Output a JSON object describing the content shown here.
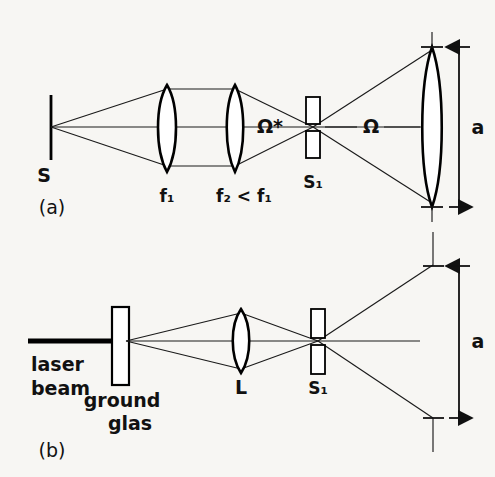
{
  "figure": {
    "background_color": "#f7f6f3",
    "ink_color": "#111111",
    "width": 495,
    "height": 477
  },
  "panels": [
    {
      "id": "panel-a",
      "label": "(a)",
      "description": "Incoherent source imaged through two lenses onto a slit, then diverging to a collecting lens",
      "elements": {
        "source_label": "S",
        "lens1_label": "f₁",
        "lens2_label": "f₂ < f₁",
        "slit_label": "S₁",
        "solid_angle_star": "Ω*",
        "solid_angle": "Ω",
        "aperture_label": "a"
      }
    },
    {
      "id": "panel-b",
      "label": "(b)",
      "description": "Laser beam through ground glass and lens focused onto a slit, then diverging over aperture a",
      "elements": {
        "beam_label_line1": "laser",
        "beam_label_line2": "beam",
        "diffuser_label_line1": "ground",
        "diffuser_label_line2": "glas",
        "lens_label": "L",
        "slit_label": "S₁",
        "aperture_label": "a"
      }
    }
  ],
  "icons": {
    "source_bar": "vertical-bar-icon",
    "lens": "biconvex-lens-icon",
    "slit": "hatched-slit-icon",
    "ground_glass": "stippled-plate-icon",
    "dimension_arrow": "double-headed-arrow-icon",
    "laser_beam": "thick-line-icon"
  }
}
